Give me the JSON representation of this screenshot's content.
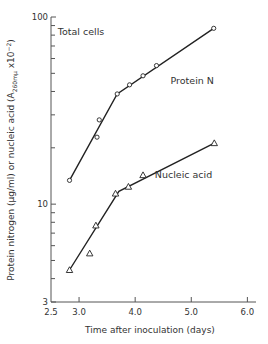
{
  "chart_data": {
    "type": "line",
    "title": "",
    "xlabel": "Time after inoculation (days)",
    "ylabel": "Protein nitrogen (μg/ml) or nucleic acid (A260mμ x10⁻²)",
    "ylabel_parts": {
      "main": "Protein nitrogen (μg/ml) or nucleic acid (A",
      "sub": "260mμ",
      "tail": " x10",
      "sup": "−2",
      "close": ")"
    },
    "xscale": "linear",
    "yscale": "log",
    "xlim": [
      2.5,
      6.1
    ],
    "ylim": [
      3,
      100
    ],
    "xticks": [
      2.5,
      3.0,
      4.0,
      5.0,
      6.0
    ],
    "xtick_labels": [
      "2.5",
      "3.0",
      "4.0",
      "5.0",
      "6.0"
    ],
    "yticks_major": [
      3,
      10,
      100
    ],
    "ytick_labels": [
      "3",
      "10",
      "100"
    ],
    "yticks_minor": [
      4,
      5,
      6,
      7,
      8,
      9,
      20,
      30,
      40,
      50,
      60,
      70,
      80,
      90
    ],
    "grid": false,
    "annotations": [
      {
        "text": "Total cells",
        "x": 2.62,
        "y": 80
      },
      {
        "text": "Protein N",
        "x": 4.63,
        "y": 44
      },
      {
        "text": "Nucleic acid",
        "x": 4.35,
        "y": 13.8
      }
    ],
    "series": [
      {
        "name": "Protein N",
        "marker": "circle",
        "points": [
          [
            2.83,
            13.4
          ],
          [
            3.32,
            22.8
          ],
          [
            3.36,
            28.2
          ],
          [
            3.68,
            38.8
          ],
          [
            3.9,
            43.4
          ],
          [
            4.14,
            48.5
          ],
          [
            4.38,
            55.0
          ],
          [
            5.4,
            87.0
          ]
        ],
        "fit_line": [
          [
            2.83,
            13.4
          ],
          [
            3.68,
            38.8
          ],
          [
            5.4,
            87.0
          ]
        ]
      },
      {
        "name": "Nucleic acid",
        "marker": "triangle",
        "points": [
          [
            2.83,
            4.45
          ],
          [
            3.19,
            5.46
          ],
          [
            3.3,
            7.7
          ],
          [
            3.65,
            11.4
          ],
          [
            3.88,
            12.4
          ],
          [
            4.14,
            14.3
          ],
          [
            5.41,
            21.2
          ]
        ],
        "fit_line": [
          [
            2.83,
            4.45
          ],
          [
            3.71,
            11.7
          ],
          [
            5.41,
            21.2
          ]
        ]
      }
    ]
  }
}
